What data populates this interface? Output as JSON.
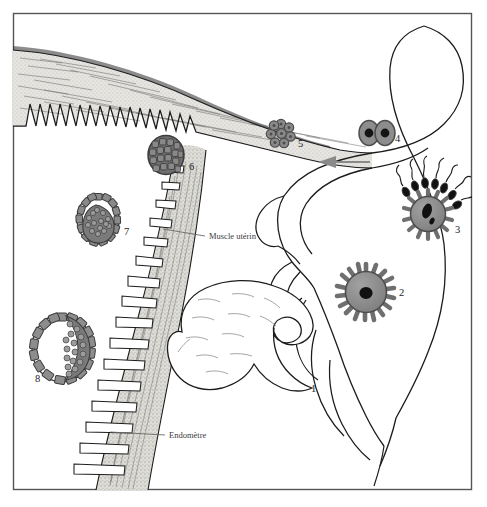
{
  "figure": {
    "language": "fr",
    "frame": {
      "border_color": "#555555"
    },
    "palette": {
      "background": "#ffffff",
      "ink": "#1c1c1c",
      "tissue_fill": "#e3e2de",
      "cell_fill": "#8c8c8c",
      "cell_dark": "#6f6f6f",
      "nucleus": "#141414",
      "label_text": "#3b3b3b",
      "arrow": "#8a8a8a"
    },
    "annotations": [
      {
        "id": "muscle-uterin",
        "text": "Muscle utérin",
        "x": 208,
        "y": 239,
        "leader_from_x": 205,
        "leader_from_y": 237,
        "leader_to_x": 163,
        "leader_to_y": 229
      },
      {
        "id": "endometre",
        "text": "Endomètre",
        "x": 168,
        "y": 438,
        "leader_from_x": 165,
        "leader_from_y": 436,
        "leader_to_x": 110,
        "leader_to_y": 432
      }
    ],
    "stage_numbers": [
      {
        "id": "stage-1",
        "label": "1",
        "x": 311,
        "y": 392,
        "structure": "ovary-with-follicle"
      },
      {
        "id": "stage-2",
        "label": "2",
        "x": 399,
        "y": 296,
        "structure": "oocyte-corona-radiata"
      },
      {
        "id": "stage-3",
        "label": "3",
        "x": 455,
        "y": 233,
        "structure": "fertilization-sperm"
      },
      {
        "id": "stage-4",
        "label": "4",
        "x": 395,
        "y": 142,
        "structure": "two-cell-embryo"
      },
      {
        "id": "stage-5",
        "label": "5",
        "x": 298,
        "y": 147,
        "structure": "morula"
      },
      {
        "id": "stage-6",
        "label": "6",
        "x": 189,
        "y": 170,
        "structure": "late-morula"
      },
      {
        "id": "stage-7",
        "label": "7",
        "x": 124,
        "y": 235,
        "structure": "blastocyst"
      },
      {
        "id": "stage-8",
        "label": "8",
        "x": 35,
        "y": 382,
        "structure": "implanting-blastocyst"
      }
    ],
    "flow_arrow": {
      "id": "direction-arrow",
      "direction": "left",
      "x1": 370,
      "y1": 162,
      "x2": 318,
      "y2": 162
    }
  }
}
